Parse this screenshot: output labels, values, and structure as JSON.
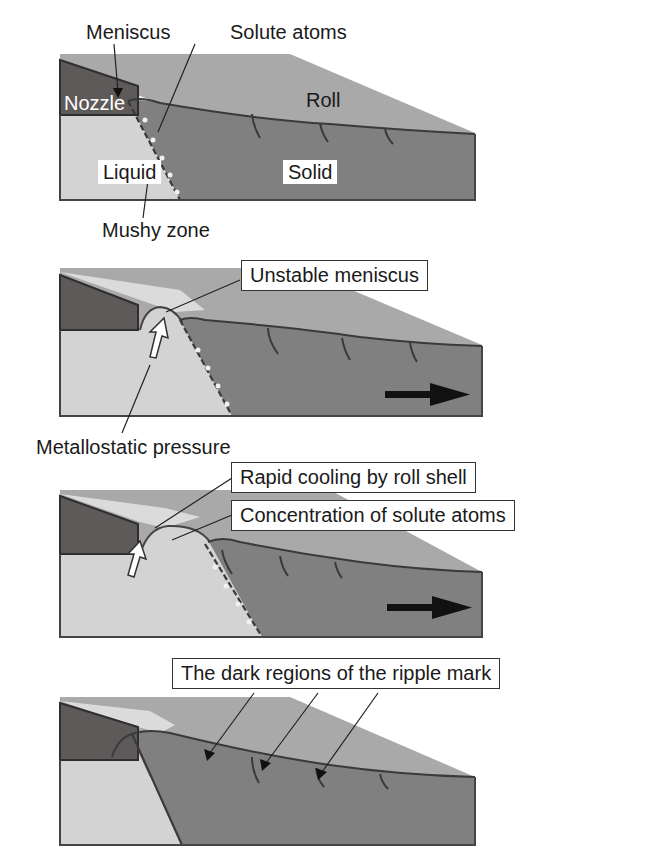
{
  "figure": {
    "panels": [
      {
        "id": 1,
        "labels": {
          "meniscus": "Meniscus",
          "solute_atoms": "Solute atoms",
          "nozzle": "Nozzle",
          "roll": "Roll",
          "liquid": "Liquid",
          "solid": "Solid",
          "mushy_zone": "Mushy zone"
        }
      },
      {
        "id": 2,
        "labels": {
          "unstable_meniscus": "Unstable meniscus",
          "metallostatic_pressure": "Metallostatic pressure"
        },
        "arrows": [
          "pressure-arrow",
          "flow-direction-arrow"
        ]
      },
      {
        "id": 3,
        "labels": {
          "rapid_cooling": "Rapid cooling by roll shell",
          "concentration": "Concentration of solute atoms"
        },
        "arrows": [
          "pressure-arrow",
          "flow-direction-arrow"
        ]
      },
      {
        "id": 4,
        "labels": {
          "ripple_dark": "The dark regions of the ripple mark"
        }
      }
    ],
    "colors": {
      "roll": "#a8a8a8",
      "nozzle": "#5e5a5a",
      "liquid": "#d2d2d2",
      "solid": "#7f7f7f",
      "outline": "#3c3c3c",
      "meniscus_highlight": "#f2f2f2"
    }
  }
}
